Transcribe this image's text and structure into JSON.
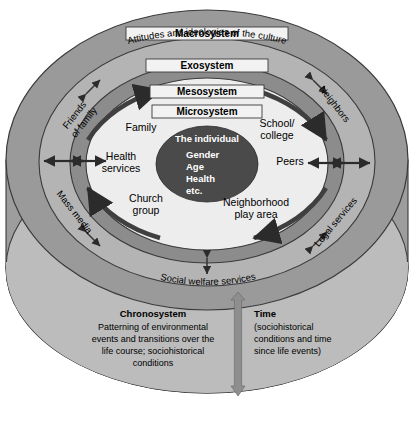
{
  "diagram": {
    "colors": {
      "background": "#ffffff",
      "macrosystem_ring": "#9a9a9a",
      "exosystem_ring": "#b4b4b4",
      "mesosystem_ring": "#8c8c8c",
      "microsystem_fill": "#ededed",
      "individual_fill": "#4a4a4a",
      "cylinder_body": "#9d9d9d",
      "chronosystem_fill": "#b9b9b9",
      "outline": "#3a3a3a",
      "arrow_dark": "#2b2b2b",
      "time_arrow": "#8e8e8e"
    },
    "rings": [
      {
        "name": "Macrosystem",
        "subtitle": "Attitudes and ideologies of the culture"
      },
      {
        "name": "Exosystem",
        "subtitle": ""
      },
      {
        "name": "Mesosystem",
        "subtitle": ""
      },
      {
        "name": "Microsystem",
        "subtitle": ""
      }
    ],
    "individual": {
      "heading": "The individual",
      "attributes": [
        "Gender",
        "Age",
        "Health",
        "etc."
      ]
    },
    "microsystem_items": [
      {
        "label_line1": "Family",
        "label_line2": ""
      },
      {
        "label_line1": "School/",
        "label_line2": "college"
      },
      {
        "label_line1": "Health",
        "label_line2": "services"
      },
      {
        "label_line1": "Peers",
        "label_line2": ""
      },
      {
        "label_line1": "Church",
        "label_line2": "group"
      },
      {
        "label_line1": "Neighborhood",
        "label_line2": "play area"
      }
    ],
    "exosystem_items": [
      {
        "label_line1": "Friends",
        "label_line2": "of family"
      },
      {
        "label_line1": "Neighbors",
        "label_line2": ""
      },
      {
        "label_line1": "Mass media",
        "label_line2": ""
      },
      {
        "label_line1": "Legal services",
        "label_line2": ""
      },
      {
        "label_line1": "Social welfare services",
        "label_line2": ""
      }
    ],
    "chronosystem": {
      "heading": "Chronosystem",
      "body_lines": [
        "Patterning of environmental",
        "events and transitions over the",
        "life course; sociohistorical",
        "conditions"
      ]
    },
    "time": {
      "heading": "Time",
      "body_lines": [
        "(sociohistorical",
        "conditions and time",
        "since life events)"
      ]
    }
  }
}
